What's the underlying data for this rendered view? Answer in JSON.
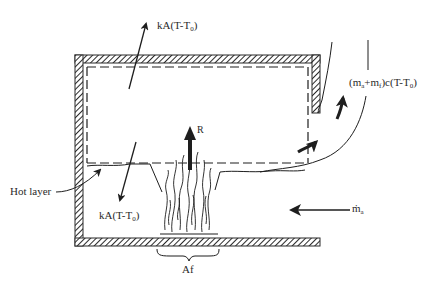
{
  "diagram": {
    "labels": {
      "heat_loss_ceiling": {
        "prefix": "kA(T-T",
        "sub": "0",
        "suffix": ")"
      },
      "heat_loss_floor": {
        "prefix": "kA(T-T",
        "sub": "0",
        "suffix": ")"
      },
      "outflow": {
        "p1": "(m",
        "s1": "a",
        "p2": "+m",
        "s2": "f",
        "p3": ")c(T-T",
        "s3": "0",
        "p4": ")"
      },
      "radiation": "R",
      "hot_layer": "Hot layer",
      "air_inflow": {
        "prefix": "ṁ",
        "sub": "a"
      },
      "fire_area": "Af"
    },
    "colors": {
      "line": "#1e1e1e",
      "wall_hatch": "#2a2a2a",
      "background": "#ffffff"
    }
  }
}
